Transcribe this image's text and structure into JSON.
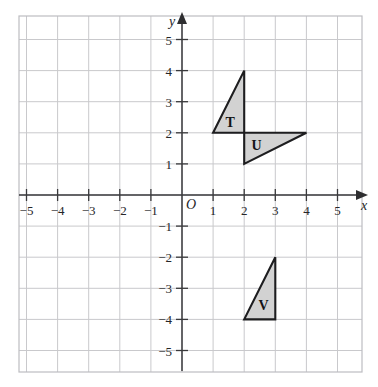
{
  "figure": {
    "background_color": "#ffffff",
    "grid_color": "#c9c9cc",
    "axis_color": "#3a3a3c",
    "shape_fill": "#d2d2d2",
    "shape_stroke": "#1d1d1f"
  },
  "axes": {
    "x_label": "x",
    "y_label": "y",
    "origin_label": "O",
    "x_ticks": [
      {
        "value": -5,
        "label": "−5"
      },
      {
        "value": -4,
        "label": "−4"
      },
      {
        "value": -3,
        "label": "−3"
      },
      {
        "value": -2,
        "label": "−2"
      },
      {
        "value": -1,
        "label": "−1"
      },
      {
        "value": 1,
        "label": "1"
      },
      {
        "value": 2,
        "label": "2"
      },
      {
        "value": 3,
        "label": "3"
      },
      {
        "value": 4,
        "label": "4"
      },
      {
        "value": 5,
        "label": "5"
      }
    ],
    "y_ticks": [
      {
        "value": 5,
        "label": "5"
      },
      {
        "value": 4,
        "label": "4"
      },
      {
        "value": 3,
        "label": "3"
      },
      {
        "value": 2,
        "label": "2"
      },
      {
        "value": 1,
        "label": "1"
      },
      {
        "value": -1,
        "label": "−1"
      },
      {
        "value": -2,
        "label": "−2"
      },
      {
        "value": -3,
        "label": "−3"
      },
      {
        "value": -4,
        "label": "−4"
      },
      {
        "value": -5,
        "label": "−5"
      }
    ]
  },
  "chart_data": {
    "type": "scatter",
    "xlabel": "x",
    "ylabel": "y",
    "xlim": [
      -5.6,
      6.2
    ],
    "ylim": [
      -5.8,
      6.0
    ],
    "grid": true,
    "grid_step": 1,
    "legend": "none",
    "shapes": [
      {
        "name": "T",
        "label": "T",
        "kind": "triangle",
        "vertices": [
          [
            1,
            2
          ],
          [
            2,
            4
          ],
          [
            2,
            2
          ]
        ],
        "label_position": [
          1.55,
          2.35
        ],
        "fill": "#d2d2d2",
        "stroke": "#1d1d1f"
      },
      {
        "name": "U",
        "label": "U",
        "kind": "triangle",
        "vertices": [
          [
            2,
            2
          ],
          [
            4,
            2
          ],
          [
            2,
            1
          ]
        ],
        "label_position": [
          2.4,
          1.6
        ],
        "fill": "#d2d2d2",
        "stroke": "#1d1d1f"
      },
      {
        "name": "V",
        "label": "V",
        "kind": "triangle",
        "vertices": [
          [
            2,
            -4
          ],
          [
            3,
            -2
          ],
          [
            3,
            -4
          ]
        ],
        "label_position": [
          2.62,
          -3.55
        ],
        "fill": "#d2d2d2",
        "stroke": "#1d1d1f"
      }
    ]
  }
}
